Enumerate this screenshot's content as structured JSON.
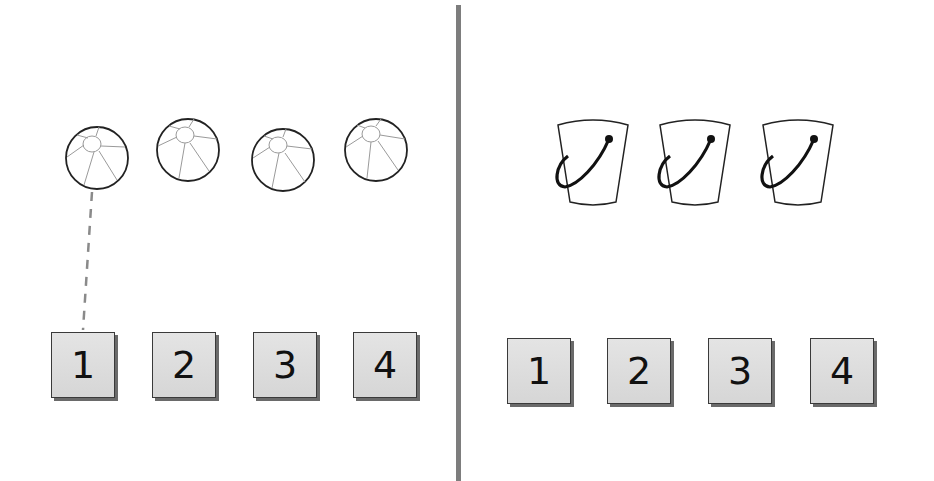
{
  "left_panel": {
    "objects": {
      "kind": "beach-ball",
      "count": 4
    },
    "numbers": [
      "1",
      "2",
      "3",
      "4"
    ],
    "connection": {
      "from_object": 1,
      "to_number": "1",
      "style": "dashed"
    }
  },
  "right_panel": {
    "objects": {
      "kind": "bucket",
      "count": 3
    },
    "numbers": [
      "1",
      "2",
      "3",
      "4"
    ]
  },
  "colors": {
    "divider": "#7d7d7d",
    "box_fill": "#dcdcdc",
    "box_shadow": "#6a6a6a",
    "outline": "#222222",
    "dashed_line": "#8a8a8a"
  }
}
